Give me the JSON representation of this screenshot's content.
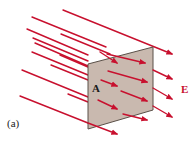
{
  "figure": {
    "surface_label": "A",
    "field_label": "E",
    "caption": "(a)",
    "colors": {
      "field_lines": "#C8102E",
      "field_label": "#C8102E",
      "surface_fill": "#C9B9AF",
      "surface_edge": "#5a5048"
    },
    "surface": {
      "corners": [
        [
          88,
          64
        ],
        [
          153,
          47
        ],
        [
          153,
          110
        ],
        [
          88,
          129
        ]
      ]
    },
    "back_lines": [
      {
        "x1": 63,
        "y1": 10,
        "x2": 172,
        "y2": 54,
        "arrow": true
      },
      {
        "x1": 32,
        "y1": 17,
        "x2": 106,
        "y2": 47,
        "arrow": false
      },
      {
        "x1": 27,
        "y1": 29,
        "x2": 88,
        "y2": 55,
        "arrow": false
      },
      {
        "x1": 61,
        "y1": 34,
        "x2": 110,
        "y2": 54,
        "arrow": false
      },
      {
        "x1": 33,
        "y1": 38,
        "x2": 88,
        "y2": 61,
        "arrow": false
      },
      {
        "x1": 35,
        "y1": 43,
        "x2": 88,
        "y2": 66,
        "arrow": false
      },
      {
        "x1": 32,
        "y1": 52,
        "x2": 88,
        "y2": 75,
        "arrow": false
      },
      {
        "x1": 60,
        "y1": 55,
        "x2": 88,
        "y2": 67,
        "arrow": false
      },
      {
        "x1": 51,
        "y1": 65,
        "x2": 88,
        "y2": 80,
        "arrow": false
      },
      {
        "x1": 22,
        "y1": 70,
        "x2": 88,
        "y2": 97,
        "arrow": false
      },
      {
        "x1": 68,
        "y1": 94,
        "x2": 88,
        "y2": 102,
        "arrow": false
      },
      {
        "x1": 20,
        "y1": 96,
        "x2": 88,
        "y2": 123,
        "arrow": false
      }
    ],
    "front_arrows": [
      {
        "x1": 100,
        "y1": 52,
        "x2": 117,
        "y2": 63
      },
      {
        "x1": 107,
        "y1": 54,
        "x2": 145,
        "y2": 63
      },
      {
        "x1": 108,
        "y1": 71,
        "x2": 147,
        "y2": 82
      },
      {
        "x1": 101,
        "y1": 80,
        "x2": 117,
        "y2": 86
      },
      {
        "x1": 121,
        "y1": 91,
        "x2": 147,
        "y2": 101
      },
      {
        "x1": 98,
        "y1": 100,
        "x2": 117,
        "y2": 109
      },
      {
        "x1": 123,
        "y1": 114,
        "x2": 147,
        "y2": 120
      },
      {
        "x1": 88,
        "y1": 123,
        "x2": 117,
        "y2": 134
      },
      {
        "x1": 153,
        "y1": 70,
        "x2": 172,
        "y2": 79
      },
      {
        "x1": 153,
        "y1": 88,
        "x2": 172,
        "y2": 99
      },
      {
        "x1": 153,
        "y1": 106,
        "x2": 172,
        "y2": 117
      }
    ]
  }
}
